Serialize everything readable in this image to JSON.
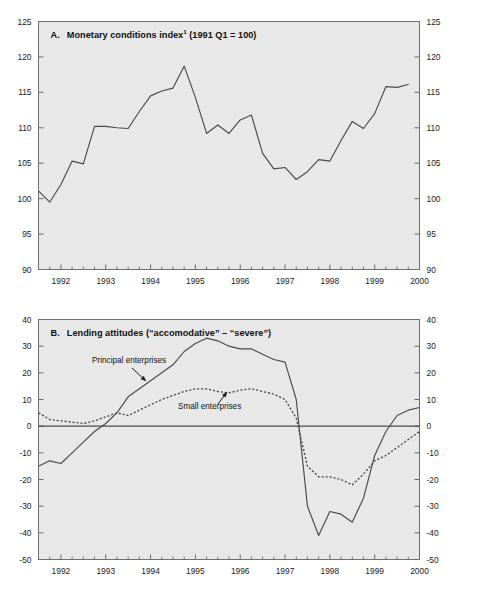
{
  "figure": {
    "background_color": "#ffffff",
    "plot_background_color": "#e8e8e8",
    "line_color": "#4a4a4a"
  },
  "panels": [
    {
      "id": "panel-a",
      "title_prefix": "A.",
      "title_main": "Monetary conditions index",
      "title_superscript": "1",
      "title_suffix": "(1991 Q1 = 100)",
      "full_title": "A.  Monetary conditions index¹ (1991 Q1 = 100)"
    },
    {
      "id": "panel-b",
      "title_prefix": "B.",
      "title_main": "Lending attitudes (“accomodative” – “severe”)",
      "title_superscript": "",
      "title_suffix": "",
      "full_title": "B.  Lending attitudes (“accomodative” – “severe”)"
    }
  ],
  "chart_data": [
    {
      "type": "line",
      "title": "A.  Monetary conditions index¹ (1991 Q1 = 100)",
      "xlabel": "",
      "ylabel": "",
      "xlim": [
        1991.5,
        2000.0
      ],
      "ylim": [
        90,
        125
      ],
      "yticks": [
        90,
        95,
        100,
        105,
        110,
        115,
        120,
        125
      ],
      "ytick_labels": [
        "90",
        "95",
        "100",
        "105",
        "110",
        "115",
        "120",
        "125"
      ],
      "xticks": [
        1992,
        1993,
        1994,
        1995,
        1996,
        1997,
        1998,
        1999,
        2000
      ],
      "xtick_labels": [
        "1992",
        "1993",
        "1994",
        "1995",
        "1996",
        "1997",
        "1998",
        "1999",
        "2000"
      ],
      "minor_xtick_interval": 0.25,
      "grid": false,
      "legend": "none",
      "dual_y_axis": true,
      "series": [
        {
          "name": "Monetary conditions index",
          "style": "solid",
          "x": [
            1991.5,
            1991.75,
            1992.0,
            1992.25,
            1992.5,
            1992.75,
            1993.0,
            1993.25,
            1993.5,
            1993.75,
            1994.0,
            1994.25,
            1994.5,
            1994.75,
            1995.0,
            1995.25,
            1995.5,
            1995.75,
            1996.0,
            1996.25,
            1996.5,
            1996.75,
            1997.0,
            1997.25,
            1997.5,
            1997.75,
            1998.0,
            1998.25,
            1998.5,
            1998.75,
            1999.0,
            1999.25,
            1999.5,
            1999.75
          ],
          "values": [
            101.1,
            99.5,
            102.0,
            105.3,
            104.9,
            110.2,
            110.2,
            110.0,
            109.9,
            112.3,
            114.5,
            115.2,
            115.6,
            118.7,
            114.3,
            109.2,
            110.4,
            109.2,
            111.1,
            111.8,
            106.4,
            104.2,
            104.4,
            102.7,
            103.8,
            105.5,
            105.3,
            108.2,
            110.9,
            109.9,
            112.0,
            115.8,
            115.7,
            116.1
          ]
        }
      ]
    },
    {
      "type": "line",
      "title": "B.  Lending attitudes (“accomodative” – “severe”)",
      "xlabel": "",
      "ylabel": "",
      "xlim": [
        1991.5,
        2000.0
      ],
      "ylim": [
        -50,
        40
      ],
      "yticks": [
        -50,
        -40,
        -30,
        -20,
        -10,
        0,
        10,
        20,
        30,
        40
      ],
      "ytick_labels": [
        "-50",
        "-40",
        "-30",
        "-20",
        "-10",
        "0",
        "10",
        "20",
        "30",
        "40"
      ],
      "xticks": [
        1992,
        1993,
        1994,
        1995,
        1996,
        1997,
        1998,
        1999,
        2000
      ],
      "xtick_labels": [
        "1992",
        "1993",
        "1994",
        "1995",
        "1996",
        "1997",
        "1998",
        "1999",
        "2000"
      ],
      "minor_xtick_interval": 0.25,
      "grid": false,
      "legend": "inline-annotations",
      "dual_y_axis": true,
      "zero_line": 0,
      "series": [
        {
          "name": "Principal enterprises",
          "style": "solid",
          "x": [
            1991.5,
            1991.75,
            1992.0,
            1992.25,
            1992.5,
            1992.75,
            1993.0,
            1993.25,
            1993.5,
            1993.75,
            1994.0,
            1994.25,
            1994.5,
            1994.75,
            1995.0,
            1995.25,
            1995.5,
            1995.75,
            1996.0,
            1996.25,
            1996.5,
            1996.75,
            1997.0,
            1997.25,
            1997.5,
            1997.75,
            1998.0,
            1998.25,
            1998.5,
            1998.75,
            1999.0,
            1999.25,
            1999.5,
            1999.75,
            2000.0
          ],
          "values": [
            -15,
            -13,
            -14,
            -10,
            -6,
            -2,
            1,
            5,
            11,
            14,
            17,
            20,
            23,
            28,
            31,
            33,
            32,
            30,
            29,
            29,
            27,
            25,
            24,
            10,
            -30,
            -41,
            -32,
            -33,
            -36,
            -27,
            -11,
            -2,
            4,
            6,
            7
          ]
        },
        {
          "name": "Small enterprises",
          "style": "dotted",
          "x": [
            1991.5,
            1991.75,
            1992.0,
            1992.25,
            1992.5,
            1992.75,
            1993.0,
            1993.25,
            1993.5,
            1993.75,
            1994.0,
            1994.25,
            1994.5,
            1994.75,
            1995.0,
            1995.25,
            1995.5,
            1995.75,
            1996.0,
            1996.25,
            1996.5,
            1996.75,
            1997.0,
            1997.25,
            1997.5,
            1997.75,
            1998.0,
            1998.25,
            1998.5,
            1998.75,
            1999.0,
            1999.25,
            1999.5,
            1999.75,
            2000.0
          ],
          "values": [
            5,
            2.5,
            2,
            1.5,
            1,
            2,
            3.5,
            5,
            4,
            6,
            8,
            10,
            11.5,
            13,
            14,
            14,
            13,
            12.5,
            13.5,
            14,
            13,
            12,
            10,
            3,
            -15,
            -19,
            -19,
            -20,
            -22,
            -18,
            -13,
            -11,
            -8,
            -5,
            -2
          ]
        }
      ],
      "annotations": [
        {
          "name": "principal-enterprises-label",
          "text": "Principal enterprises"
        },
        {
          "name": "small-enterprises-label",
          "text": "Small enterprises"
        }
      ]
    }
  ]
}
